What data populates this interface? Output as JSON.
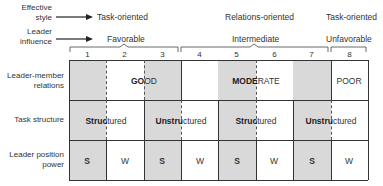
{
  "row_header_top": {
    "effective_style": "Effective style",
    "leader_influence": "Leader influence"
  },
  "effective_style": {
    "left": "Task-oriented",
    "middle": "Relations-oriented",
    "right": "Task-oriented"
  },
  "leader_influence": {
    "favorable": "Favorable",
    "intermediate": "Intermediate",
    "unfavorable": "Unfavorable"
  },
  "columns": [
    "1",
    "2",
    "3",
    "4",
    "5",
    "6",
    "7",
    "8"
  ],
  "rows": {
    "leader_member_relations": {
      "label": "Leader-member relations",
      "good_bold": "GO",
      "good_rest": "OD",
      "moderate_bold": "MODE",
      "moderate_rest": "RATE",
      "poor": "POOR"
    },
    "task_structure": {
      "label": "Task structure",
      "structured_bold": "Struc",
      "structured_rest": "tured",
      "unstructured_bold": "Unstru",
      "unstructured_rest": "ctured"
    },
    "leader_position_power": {
      "label": "Leader position power",
      "values": [
        "S",
        "W",
        "S",
        "W",
        "S",
        "W",
        "S",
        "W"
      ]
    }
  },
  "arrow_icon": "right-arrow",
  "shaded_columns": [
    1,
    3,
    5,
    7
  ]
}
